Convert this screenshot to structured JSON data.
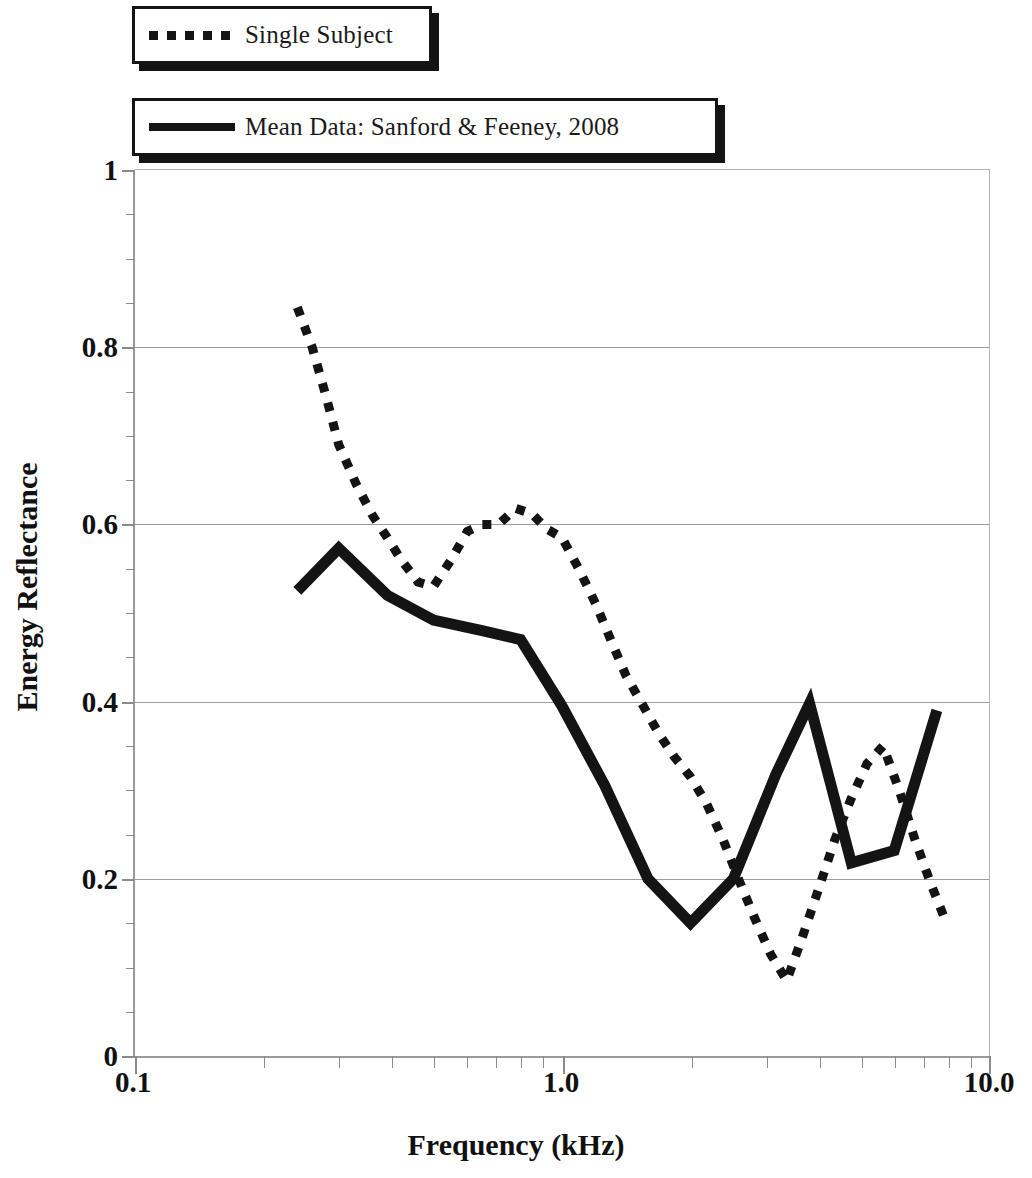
{
  "legend": {
    "position": "top-left",
    "entries": [
      {
        "label": "Single Subject",
        "style": "dotted",
        "color": "#141414"
      },
      {
        "label": "Mean Data: Sanford & Feeney, 2008",
        "style": "solid",
        "color": "#141414"
      }
    ]
  },
  "axes": {
    "x_title": "Frequency (kHz)",
    "y_title": "Energy Reflectance",
    "x_tick_labels": [
      "0.1",
      "1.0",
      "10.0"
    ],
    "y_tick_labels": [
      "0",
      "0.2",
      "0.4",
      "0.6",
      "0.8",
      "1"
    ]
  },
  "chart_data": {
    "type": "line",
    "title": "",
    "subtitle": "",
    "xlabel": "Frequency (kHz)",
    "ylabel": "Energy Reflectance",
    "xscale": "log",
    "xlim": [
      0.1,
      10.0
    ],
    "ylim": [
      0,
      1
    ],
    "xticks": [
      0.1,
      1.0,
      10.0
    ],
    "xticklabels": [
      "0.1",
      "1.0",
      "10.0"
    ],
    "yticks": [
      0,
      0.2,
      0.4,
      0.6,
      0.8,
      1
    ],
    "yticklabels": [
      "0",
      "0.2",
      "0.4",
      "0.6",
      "0.8",
      "1"
    ],
    "grid": "horizontal",
    "gridlines_y": [
      0.2,
      0.4,
      0.6,
      0.8
    ],
    "legend_position": "upper-left",
    "series": [
      {
        "name": "Single Subject",
        "style": "dotted",
        "color": "#141414",
        "x": [
          0.24,
          0.26,
          0.28,
          0.3,
          0.33,
          0.36,
          0.39,
          0.42,
          0.46,
          0.5,
          0.55,
          0.6,
          0.65,
          0.71,
          0.78,
          0.85,
          0.92,
          1.0,
          1.1,
          1.2,
          1.3,
          1.41,
          1.55,
          1.68,
          1.83,
          2.0,
          2.18,
          2.38,
          2.59,
          2.83,
          3.08,
          3.36,
          3.66,
          4.0,
          4.36,
          4.75,
          5.18,
          5.65,
          6.16,
          6.7,
          7.3,
          7.95
        ],
        "y": [
          0.845,
          0.8,
          0.745,
          0.69,
          0.645,
          0.61,
          0.585,
          0.56,
          0.535,
          0.53,
          0.56,
          0.592,
          0.6,
          0.6,
          0.618,
          0.612,
          0.595,
          0.585,
          0.548,
          0.51,
          0.47,
          0.43,
          0.395,
          0.365,
          0.338,
          0.315,
          0.285,
          0.245,
          0.2,
          0.155,
          0.115,
          0.085,
          0.135,
          0.19,
          0.245,
          0.29,
          0.33,
          0.35,
          0.3,
          0.245,
          0.195,
          0.15
        ]
      },
      {
        "name": "Mean Data: Sanford & Feeney, 2008",
        "style": "solid",
        "color": "#141414",
        "x": [
          0.24,
          0.3,
          0.39,
          0.5,
          0.65,
          0.8,
          1.0,
          1.26,
          1.59,
          2.0,
          2.52,
          3.17,
          3.8,
          4.76,
          6.0,
          7.55
        ],
        "y": [
          0.525,
          0.573,
          0.52,
          0.492,
          0.48,
          0.47,
          0.395,
          0.305,
          0.2,
          0.15,
          0.2,
          0.318,
          0.398,
          0.218,
          0.232,
          0.39
        ]
      }
    ]
  },
  "dotted_tail": {
    "x": [
      5.18,
      5.65,
      6.16,
      6.7,
      7.3,
      7.95
    ],
    "y": [
      0.33,
      0.35,
      0.3,
      0.245,
      0.195,
      0.15
    ]
  }
}
